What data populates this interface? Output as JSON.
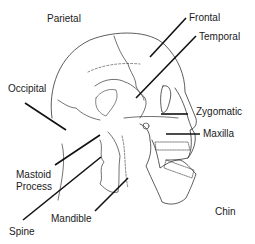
{
  "diagram": {
    "labels": {
      "parietal": "Parietal",
      "frontal": "Frontal",
      "temporal": "Temporal",
      "occipital": "Occipital",
      "zygomatic": "Zygomatic",
      "maxilla": "Maxilla",
      "mastoid_process_line1": "Mastoid",
      "mastoid_process_line2": "Process",
      "mandible": "Mandible",
      "spine": "Spine",
      "chin": "Chin"
    },
    "colors": {
      "line": "#111111",
      "outline": "#333333",
      "text": "#1a1a1a",
      "background": "#ffffff"
    }
  }
}
